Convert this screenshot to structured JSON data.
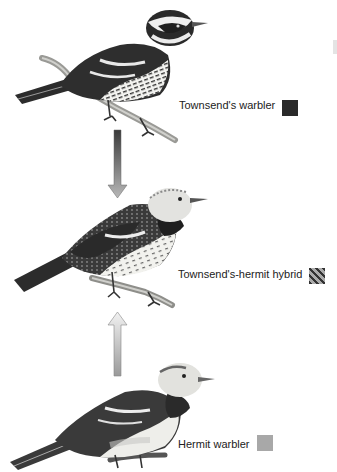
{
  "figure": {
    "type": "hybridization-diagram",
    "birds": [
      {
        "label": "Townsend's warbler",
        "legend_color": "#2a2a2a",
        "swatch_pattern": "solid-dark"
      },
      {
        "label": "Townsend's-hermit hybrid",
        "legend_color": "#777777",
        "swatch_pattern": "diagonal-stripes"
      },
      {
        "label": "Hermit warbler",
        "legend_color": "#a8a8a8",
        "swatch_pattern": "solid-light"
      }
    ],
    "arrows": [
      {
        "direction": "down",
        "from": "Townsend's warbler",
        "to": "Townsend's-hermit hybrid"
      },
      {
        "direction": "up",
        "from": "Hermit warbler",
        "to": "Townsend's-hermit hybrid"
      }
    ]
  }
}
